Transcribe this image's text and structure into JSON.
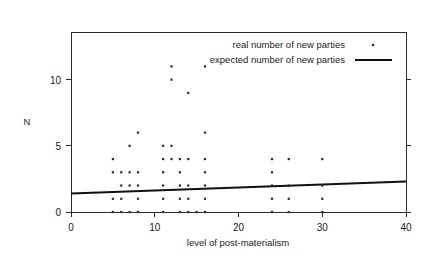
{
  "chart_data": {
    "type": "scatter",
    "title": "",
    "xlabel": "level of post-materialism",
    "ylabel": "N",
    "xlim": [
      0,
      40
    ],
    "ylim": [
      0,
      13.6
    ],
    "xticks": [
      0,
      10,
      20,
      30,
      40
    ],
    "yticks": [
      0,
      5,
      10
    ],
    "xtick_labels": [
      "0",
      "10",
      "20",
      "30",
      "40"
    ],
    "ytick_labels": [
      "0",
      "5",
      "10"
    ],
    "grid": false,
    "legend_position": "top-right",
    "series": [
      {
        "name": "real number of new parties",
        "type": "scatter",
        "marker": "point",
        "points": [
          [
            12,
            11
          ],
          [
            16,
            11
          ],
          [
            12,
            10
          ],
          [
            14,
            9
          ],
          [
            8,
            6
          ],
          [
            16,
            6
          ],
          [
            7,
            5
          ],
          [
            11,
            5
          ],
          [
            12,
            5
          ],
          [
            5,
            4
          ],
          [
            11,
            4
          ],
          [
            12,
            4
          ],
          [
            13,
            4
          ],
          [
            14,
            4
          ],
          [
            16,
            4
          ],
          [
            24,
            4
          ],
          [
            26,
            4
          ],
          [
            30,
            4
          ],
          [
            5,
            3
          ],
          [
            6,
            3
          ],
          [
            7,
            3
          ],
          [
            8,
            3
          ],
          [
            11,
            3
          ],
          [
            13,
            3
          ],
          [
            16,
            3
          ],
          [
            24,
            3
          ],
          [
            6,
            2
          ],
          [
            7,
            2
          ],
          [
            8,
            2
          ],
          [
            11,
            2
          ],
          [
            13,
            2
          ],
          [
            14,
            2
          ],
          [
            16,
            2
          ],
          [
            24,
            2
          ],
          [
            26,
            2
          ],
          [
            30,
            2
          ],
          [
            5,
            1
          ],
          [
            6,
            1
          ],
          [
            8,
            1
          ],
          [
            11,
            1
          ],
          [
            13,
            1
          ],
          [
            14,
            1
          ],
          [
            16,
            1
          ],
          [
            24,
            1
          ],
          [
            26,
            1
          ],
          [
            30,
            1
          ],
          [
            5,
            0
          ],
          [
            6,
            0
          ],
          [
            7,
            0
          ],
          [
            8,
            0
          ],
          [
            11,
            0
          ],
          [
            13,
            0
          ],
          [
            14,
            0
          ],
          [
            15,
            0
          ],
          [
            16,
            0
          ],
          [
            24,
            0
          ],
          [
            26,
            0
          ],
          [
            30,
            0
          ]
        ]
      },
      {
        "name": "expected number of new parties",
        "type": "line",
        "endpoints": [
          [
            0,
            1.4
          ],
          [
            40,
            2.3
          ]
        ]
      }
    ]
  },
  "legend": {
    "entries": [
      {
        "label": "real number of new parties",
        "marker": "point"
      },
      {
        "label": "expected number of new parties",
        "marker": "line"
      }
    ]
  },
  "axes": {
    "x_title": "level of post-materialism",
    "y_title": "N"
  }
}
